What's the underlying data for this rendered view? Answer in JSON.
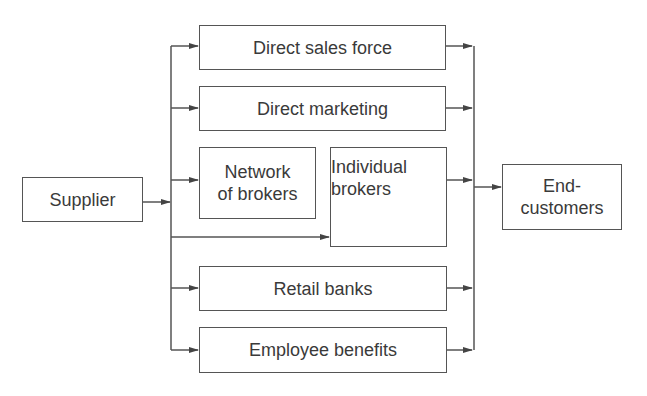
{
  "diagram": {
    "source": {
      "label": "Supplier"
    },
    "channels": [
      {
        "id": "direct-sales-force",
        "label": "Direct sales force"
      },
      {
        "id": "direct-marketing",
        "label": "Direct marketing"
      },
      {
        "id": "network-of-brokers",
        "label": "Network of brokers",
        "lines": [
          "Network",
          "of brokers"
        ]
      },
      {
        "id": "individual-brokers",
        "label": "Individual brokers",
        "lines": [
          "Individual",
          "brokers"
        ]
      },
      {
        "id": "retail-banks",
        "label": "Retail banks"
      },
      {
        "id": "employee-benefits",
        "label": "Employee benefits"
      }
    ],
    "target": {
      "label": "End-customers",
      "lines": [
        "End-",
        "customers"
      ]
    },
    "edges": [
      {
        "from": "Supplier",
        "to": "Direct sales force"
      },
      {
        "from": "Supplier",
        "to": "Direct marketing"
      },
      {
        "from": "Supplier",
        "to": "Network of brokers"
      },
      {
        "from": "Supplier",
        "to": "Individual brokers"
      },
      {
        "from": "Supplier",
        "to": "Retail banks"
      },
      {
        "from": "Supplier",
        "to": "Employee benefits"
      },
      {
        "from": "Direct sales force",
        "to": "End-customers"
      },
      {
        "from": "Direct marketing",
        "to": "End-customers"
      },
      {
        "from": "Individual brokers",
        "to": "End-customers"
      },
      {
        "from": "Retail banks",
        "to": "End-customers"
      },
      {
        "from": "Employee benefits",
        "to": "End-customers"
      }
    ]
  }
}
